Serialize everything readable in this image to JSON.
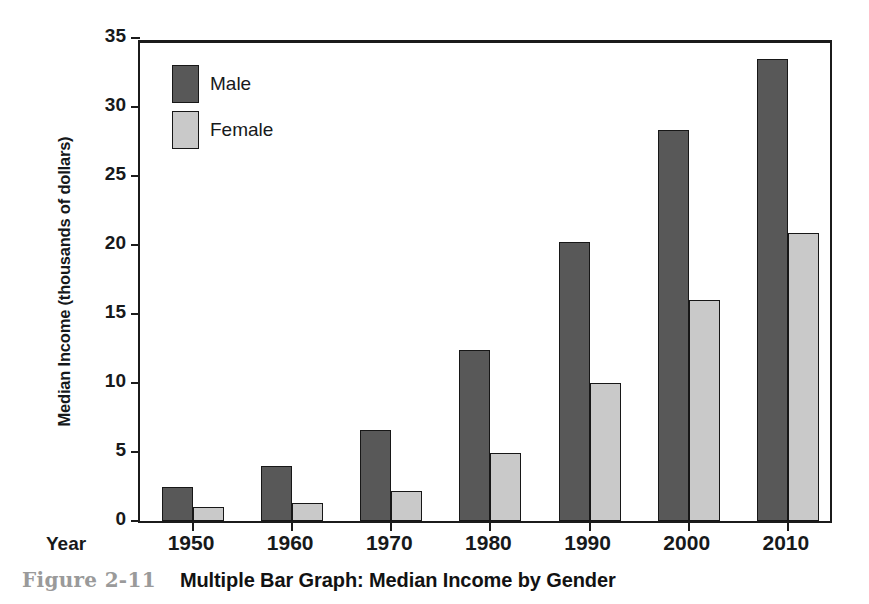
{
  "caption": {
    "figure_number": "Figure 2-11",
    "title": "Multiple Bar Graph: Median Income by Gender"
  },
  "axis": {
    "x_name": "Year"
  },
  "chart_data": {
    "type": "bar",
    "title": "Multiple Bar Graph: Median Income by Gender",
    "xlabel": "Year",
    "ylabel": "Median Income (thousands of dollars)",
    "categories": [
      "1950",
      "1960",
      "1970",
      "1980",
      "1990",
      "2000",
      "2010"
    ],
    "series": [
      {
        "name": "Male",
        "color": "#585858",
        "values": [
          2.5,
          4.0,
          6.6,
          12.4,
          20.2,
          28.3,
          33.5
        ]
      },
      {
        "name": "Female",
        "color": "#c9c9c9",
        "values": [
          1.0,
          1.3,
          2.2,
          4.9,
          10.0,
          16.0,
          20.9
        ]
      }
    ],
    "ylim": [
      0,
      35
    ],
    "yticks": [
      0,
      5,
      10,
      15,
      20,
      25,
      30,
      35
    ],
    "ytick_labels": [
      "0",
      "5",
      "10",
      "15",
      "20",
      "25",
      "30",
      "35"
    ],
    "grid": false,
    "legend_position": "top-left"
  }
}
